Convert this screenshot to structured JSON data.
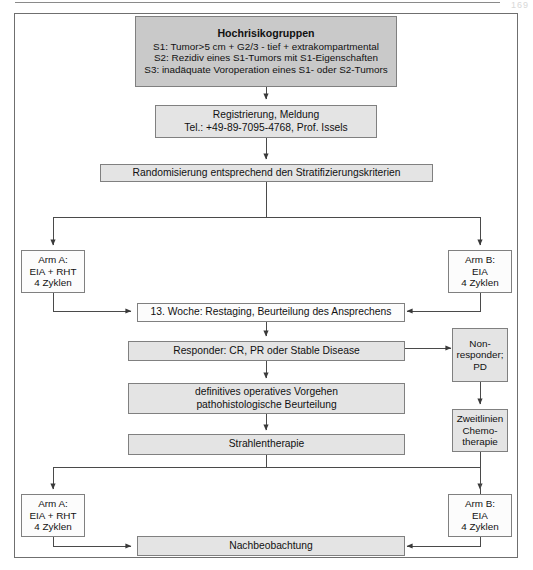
{
  "page": {
    "number": "169"
  },
  "nodes": {
    "hochrisiko": {
      "title": "Hochrisikogruppen",
      "line1": "S1: Tumor>5 cm + G2/3 - tief + extrakompartmental",
      "line2": "S2: Rezidiv eines S1-Tumors mit S1-Eigenschaften",
      "line3": "S3: inadäquate Voroperation eines S1- oder S2-Tumors"
    },
    "registrierung": {
      "line1": "Registrierung, Meldung",
      "line2": "Tel.: +49-89-7095-4768, Prof. Issels"
    },
    "randomisierung": {
      "line1": "Randomisierung entsprechend den Stratifizierungskriterien"
    },
    "arm_a_top": {
      "line1": "Arm A:",
      "line2": "EIA + RHT",
      "line3": "4 Zyklen"
    },
    "arm_b_top": {
      "line1": "Arm B:",
      "line2": "EIA",
      "line3": "4 Zyklen"
    },
    "restaging": {
      "line1": "13. Woche: Restaging, Beurteilung des Ansprechens"
    },
    "responder": {
      "line1": "Responder: CR, PR oder Stable Disease"
    },
    "nonresponder": {
      "line1": "Non-",
      "line2": "responder;",
      "line3": "PD"
    },
    "operation": {
      "line1": "definitives operatives Vorgehen",
      "line2": "pathohistologische Beurteilung"
    },
    "zweitlinien": {
      "line1": "Zweitlinien",
      "line2": "Chemo-",
      "line3": "therapie"
    },
    "strahlentherapie": {
      "line1": "Strahlentherapie"
    },
    "arm_a_bottom": {
      "line1": "Arm A:",
      "line2": "EIA + RHT",
      "line3": "4 Zyklen"
    },
    "arm_b_bottom": {
      "line1": "Arm B:",
      "line2": "EIA",
      "line3": "4 Zyklen"
    },
    "nachbeobachtung": {
      "line1": "Nachbeobachtung"
    }
  },
  "colors": {
    "fill_dark": "#c9c9c9",
    "fill_light": "#e4e4e4",
    "fill_white": "#fcfcfc",
    "border": "#808080",
    "frame_border": "#6f6f6f",
    "wire": "#4a4a4a",
    "text": "#111111"
  }
}
